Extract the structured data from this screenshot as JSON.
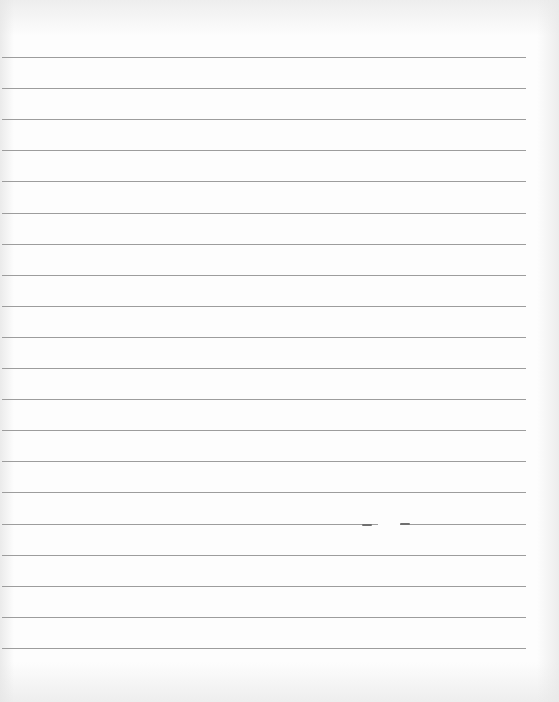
{
  "page": {
    "type": "blank-ruled-sheet",
    "background_color": "#fdfdfd",
    "line_color": "#9d9d9d",
    "line_count": 20,
    "first_line_y": 57,
    "line_spacing": 31.1,
    "line_left": 2,
    "line_width": 524,
    "text": ""
  }
}
